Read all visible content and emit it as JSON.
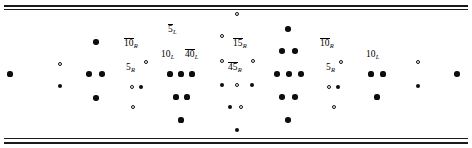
{
  "figure": {
    "kind": "weight-diagram",
    "width": 472,
    "height": 148,
    "background_color": "#ffffff",
    "ink_color": "#0d0d0d",
    "rules": [
      {
        "name": "top-rule-outer",
        "y": 5,
        "weight": "thick"
      },
      {
        "name": "top-rule-inner",
        "y": 9,
        "weight": "thin"
      },
      {
        "name": "bottom-rule-inner",
        "y": 138,
        "weight": "thin"
      },
      {
        "name": "bottom-rule-outer",
        "y": 142,
        "weight": "thick"
      }
    ]
  },
  "labels": [
    {
      "name": "label-5bar-L",
      "text": "5",
      "bar": true,
      "sub": "L",
      "x": 168,
      "y": 19
    },
    {
      "name": "label-10bar-R-left",
      "text": "10",
      "bar": true,
      "sub": "R",
      "x": 124,
      "y": 33
    },
    {
      "name": "label-15bar-R",
      "text": "15",
      "bar": true,
      "sub": "R",
      "x": 233,
      "y": 33
    },
    {
      "name": "label-10bar-R-right",
      "text": "10",
      "bar": true,
      "sub": "R",
      "x": 320,
      "y": 33
    },
    {
      "name": "label-10-L",
      "text": "10",
      "bar": false,
      "sub": "L",
      "x": 161,
      "y": 44
    },
    {
      "name": "label-40bar-L",
      "text": "40",
      "bar": true,
      "sub": "L",
      "x": 185,
      "y": 44
    },
    {
      "name": "label-10-L-right",
      "text": "10",
      "bar": false,
      "sub": "L",
      "x": 366,
      "y": 44
    },
    {
      "name": "label-5-R-left",
      "text": "5",
      "bar": false,
      "sub": "R",
      "x": 126,
      "y": 57
    },
    {
      "name": "label-45bar-R",
      "text": "45",
      "bar": true,
      "sub": "R",
      "x": 228,
      "y": 57
    },
    {
      "name": "label-5-R-right",
      "text": "5",
      "bar": false,
      "sub": "R",
      "x": 326,
      "y": 57
    }
  ],
  "nodes": [
    {
      "name": "node-far-left",
      "x": 10,
      "y": 74,
      "r": 2.6,
      "fill": "filled"
    },
    {
      "name": "node-l1-up",
      "x": 60,
      "y": 64,
      "r": 2.0,
      "fill": "open"
    },
    {
      "name": "node-l1-down",
      "x": 60,
      "y": 86,
      "r": 2.3,
      "fill": "filled"
    },
    {
      "name": "node-l2-top",
      "x": 96,
      "y": 42,
      "r": 2.8,
      "fill": "filled"
    },
    {
      "name": "node-l2-mid-a",
      "x": 89,
      "y": 74,
      "r": 2.8,
      "fill": "filled"
    },
    {
      "name": "node-l2-mid-b",
      "x": 102,
      "y": 74,
      "r": 2.8,
      "fill": "filled"
    },
    {
      "name": "node-l2-bot",
      "x": 96,
      "y": 98,
      "r": 2.8,
      "fill": "filled"
    },
    {
      "name": "node-l3-up",
      "x": 146,
      "y": 62,
      "r": 2.0,
      "fill": "open"
    },
    {
      "name": "node-l3-mid-open",
      "x": 132,
      "y": 87,
      "r": 2.0,
      "fill": "open"
    },
    {
      "name": "node-l3-mid-fill",
      "x": 141,
      "y": 87,
      "r": 2.4,
      "fill": "filled"
    },
    {
      "name": "node-l3-bot",
      "x": 133,
      "y": 107,
      "r": 2.0,
      "fill": "open"
    },
    {
      "name": "node-c1-mid-a",
      "x": 170,
      "y": 74,
      "r": 2.6,
      "fill": "filled"
    },
    {
      "name": "node-c1-mid-b",
      "x": 181,
      "y": 74,
      "r": 2.6,
      "fill": "filled"
    },
    {
      "name": "node-c1-mid-c",
      "x": 192,
      "y": 74,
      "r": 2.6,
      "fill": "filled"
    },
    {
      "name": "node-c1-low-a",
      "x": 176,
      "y": 97,
      "r": 2.6,
      "fill": "filled"
    },
    {
      "name": "node-c1-low-b",
      "x": 187,
      "y": 97,
      "r": 2.6,
      "fill": "filled"
    },
    {
      "name": "node-c1-bot",
      "x": 181,
      "y": 120,
      "r": 2.6,
      "fill": "filled"
    },
    {
      "name": "node-center-top",
      "x": 237,
      "y": 14,
      "r": 2.0,
      "fill": "open"
    },
    {
      "name": "node-center-r2",
      "x": 222,
      "y": 36,
      "r": 2.0,
      "fill": "open"
    },
    {
      "name": "node-center-r3-a",
      "x": 222,
      "y": 61,
      "r": 2.0,
      "fill": "open"
    },
    {
      "name": "node-center-r3-b",
      "x": 253,
      "y": 61,
      "r": 2.0,
      "fill": "open"
    },
    {
      "name": "node-center-r4-a",
      "x": 222,
      "y": 85,
      "r": 2.4,
      "fill": "filled"
    },
    {
      "name": "node-center-r4-b",
      "x": 237,
      "y": 85,
      "r": 2.0,
      "fill": "open"
    },
    {
      "name": "node-center-r4-c",
      "x": 252,
      "y": 85,
      "r": 2.4,
      "fill": "filled"
    },
    {
      "name": "node-center-r5-a",
      "x": 230,
      "y": 107,
      "r": 2.4,
      "fill": "filled"
    },
    {
      "name": "node-center-r5-b",
      "x": 241,
      "y": 107,
      "r": 2.0,
      "fill": "open"
    },
    {
      "name": "node-center-bot",
      "x": 237,
      "y": 130,
      "r": 2.4,
      "fill": "filled"
    },
    {
      "name": "node-r1-top",
      "x": 288,
      "y": 29,
      "r": 2.8,
      "fill": "filled"
    },
    {
      "name": "node-r1-r2-a",
      "x": 282,
      "y": 51,
      "r": 2.8,
      "fill": "filled"
    },
    {
      "name": "node-r1-r2-b",
      "x": 295,
      "y": 51,
      "r": 2.8,
      "fill": "filled"
    },
    {
      "name": "node-r1-r3-a",
      "x": 277,
      "y": 74,
      "r": 2.8,
      "fill": "filled"
    },
    {
      "name": "node-r1-r3-b",
      "x": 289,
      "y": 74,
      "r": 2.8,
      "fill": "filled"
    },
    {
      "name": "node-r1-r3-c",
      "x": 301,
      "y": 74,
      "r": 2.8,
      "fill": "filled"
    },
    {
      "name": "node-r1-r4-a",
      "x": 282,
      "y": 97,
      "r": 2.8,
      "fill": "filled"
    },
    {
      "name": "node-r1-r4-b",
      "x": 295,
      "y": 97,
      "r": 2.8,
      "fill": "filled"
    },
    {
      "name": "node-r1-bot",
      "x": 288,
      "y": 120,
      "r": 2.8,
      "fill": "filled"
    },
    {
      "name": "node-r2-up",
      "x": 341,
      "y": 62,
      "r": 2.0,
      "fill": "open"
    },
    {
      "name": "node-r2-mid-open",
      "x": 329,
      "y": 87,
      "r": 2.0,
      "fill": "open"
    },
    {
      "name": "node-r2-mid-fill",
      "x": 338,
      "y": 87,
      "r": 2.4,
      "fill": "filled"
    },
    {
      "name": "node-r2-bot",
      "x": 334,
      "y": 107,
      "r": 2.0,
      "fill": "open"
    },
    {
      "name": "node-r3-mid-a",
      "x": 371,
      "y": 74,
      "r": 2.6,
      "fill": "filled"
    },
    {
      "name": "node-r3-mid-b",
      "x": 383,
      "y": 74,
      "r": 2.6,
      "fill": "filled"
    },
    {
      "name": "node-r3-bot",
      "x": 377,
      "y": 97,
      "r": 2.6,
      "fill": "filled"
    },
    {
      "name": "node-r4-up",
      "x": 418,
      "y": 62,
      "r": 2.0,
      "fill": "open"
    },
    {
      "name": "node-r4-down",
      "x": 418,
      "y": 86,
      "r": 2.3,
      "fill": "filled"
    },
    {
      "name": "node-far-right",
      "x": 457,
      "y": 74,
      "r": 2.8,
      "fill": "filled"
    }
  ]
}
